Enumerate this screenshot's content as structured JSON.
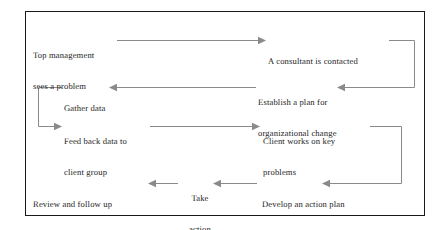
{
  "diagram": {
    "frame": {
      "border_color": "#1a1a1a",
      "background_color": "#ffffff"
    },
    "connector_color": "#8a8a8a",
    "text_color": "#1c1c1c",
    "nodes": [
      {
        "id": "top-management",
        "line1": "Top management",
        "line2": "sees a problem"
      },
      {
        "id": "consultant-contacted",
        "line1": "A consultant is contacted",
        "line2": ""
      },
      {
        "id": "gather-data",
        "line1": "Gather data",
        "line2": ""
      },
      {
        "id": "establish-plan",
        "line1": "Establish a plan for",
        "line2": "organizational change"
      },
      {
        "id": "feed-back-data",
        "line1": "Feed back data to",
        "line2": "client group"
      },
      {
        "id": "client-works",
        "line1": "Client works on key",
        "line2": "problems"
      },
      {
        "id": "review-follow-up",
        "line1": "Review and follow up",
        "line2": ""
      },
      {
        "id": "take-action",
        "line1": "Take",
        "line2": "action"
      },
      {
        "id": "develop-action-plan",
        "line1": "Develop an action plan",
        "line2": ""
      }
    ]
  }
}
